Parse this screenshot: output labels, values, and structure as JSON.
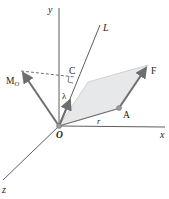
{
  "diagram": {
    "labels": {
      "y_axis": "y",
      "x_axis": "x",
      "z_axis": "z",
      "line_L": "L",
      "moment": "M",
      "moment_sub": "O",
      "point_C": "C",
      "unit_vector": "λ",
      "force": "F",
      "point_A": "A",
      "position_vector": "r",
      "origin": "O"
    },
    "colors": {
      "axis": "#333333",
      "vector": "#6e6e6e",
      "plane_fill": "#e6e8ea",
      "plane_stroke": "#b8bcc0",
      "point": "#9a9a9a"
    }
  }
}
